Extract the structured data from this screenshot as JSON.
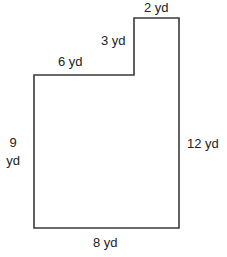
{
  "figure": {
    "type": "composite-rectilinear-shape",
    "stroke_color": "#3a3a3a",
    "fill_color": "#ffffff",
    "vertices": [
      [
        34,
        75
      ],
      [
        134,
        75
      ],
      [
        134,
        18
      ],
      [
        179,
        18
      ],
      [
        179,
        228
      ],
      [
        34,
        228
      ]
    ],
    "labels": {
      "top_step": "2 yd",
      "step_rise": "3 yd",
      "upper_left": "6 yd",
      "left_line1": "9",
      "left_line2": "yd",
      "right": "12 yd",
      "bottom": "8 yd"
    }
  }
}
